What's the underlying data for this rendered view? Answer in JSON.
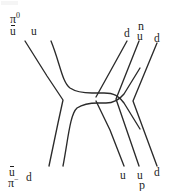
{
  "figure": {
    "type": "quark-line-diagram",
    "background_color": "#ffffff",
    "line_color": "#2b2b2b",
    "text_color": "#1d1d1d",
    "width": 172,
    "height": 191
  },
  "labels": {
    "top_left": {
      "hadron": "π",
      "hadron_charge": "0",
      "quark_antiup": "u",
      "quark_up": "u"
    },
    "bottom_left": {
      "hadron": "π",
      "hadron_charge": "−",
      "quark_antiup": "u",
      "quark_down": "d"
    },
    "top_right": {
      "hadron": "n",
      "quark_down_outer": "d",
      "quark_up": "u",
      "quark_down_inner": "d"
    },
    "bottom_right": {
      "hadron": "p",
      "quark_up_outer": "u",
      "quark_up_inner": "u",
      "quark_down": "d"
    }
  },
  "paths": {
    "antiup_incoming": "M 24,40 L 62,103 L 48,168",
    "up_incoming": "M 50,40 C 62,66 64,86 82,92 L 110,92 C 126,92 132,100 140,112",
    "down_incoming": "M 62,168 C 68,140 70,112 86,104 L 110,104 C 126,104 132,96 140,84",
    "down_outgoing_top": "M 128,40 L 96,98",
    "up_outgoing_bottom": "M 96,98 L 124,168",
    "up_bend_upper": "M 140,40 L 116,98 L 140,168",
    "down_bend_outer": "M 156,42 L 132,100 L 156,168"
  },
  "annotations": {
    "vertex_note": "quark rearrangement vertex"
  }
}
